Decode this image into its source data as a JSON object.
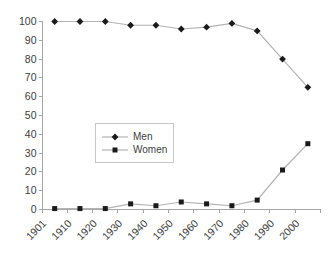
{
  "chart_data": {
    "type": "line",
    "title": "",
    "xlabel": "",
    "ylabel": "",
    "categories": [
      "1901",
      "1910",
      "1920",
      "1930",
      "1940",
      "1950",
      "1960",
      "1970",
      "1980",
      "1990",
      "2000"
    ],
    "series": [
      {
        "name": "Men",
        "marker": "diamond",
        "values": [
          100,
          100,
          100,
          98,
          98,
          96,
          97,
          99,
          95,
          80,
          65
        ]
      },
      {
        "name": "Women",
        "marker": "square",
        "values": [
          0.5,
          0.5,
          0.5,
          3,
          2,
          4,
          3,
          2,
          5,
          21,
          35
        ]
      }
    ],
    "ylim": [
      0,
      100
    ],
    "ytick_step": 10,
    "grid": false,
    "x_label_rotation_deg": 45,
    "legend_position": "inside-center-left",
    "colors": {
      "background": "#ffffff",
      "line": "#b3b3b3",
      "marker": "#1a1a1a",
      "axis": "#a6a6a6",
      "text": "#404040",
      "legend_border": "#c6c6c6"
    }
  }
}
